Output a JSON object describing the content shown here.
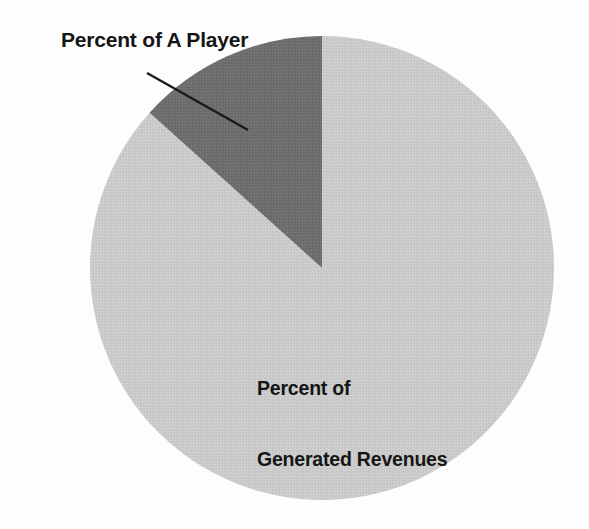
{
  "figure": {
    "background_color": "#fdfdfd",
    "width": 589,
    "height": 529
  },
  "callout": {
    "label": "Percent of A Player",
    "leader_line": {
      "from_x": 147,
      "from_y": 73,
      "to_x": 248,
      "to_y": 130,
      "color": "#1a1a1a"
    }
  },
  "center_label": {
    "line1": "Percent of",
    "line2": "Generated Revenues"
  },
  "chart_data": {
    "type": "pie",
    "title": "",
    "subtitle": "",
    "xlabel": "",
    "ylabel": "",
    "legend_position": "none",
    "grid": false,
    "center": {
      "cx": 322,
      "cy": 268
    },
    "radius": 232,
    "start_angle_deg": 0,
    "direction": "counterclockwise",
    "categories": [
      "Percent of A Player",
      "Percent of Generated Revenues"
    ],
    "values": [
      13,
      87
    ],
    "value_unit": "percent",
    "slices": [
      {
        "label": "Percent of A Player",
        "value": 13,
        "angle_deg": 48,
        "color": "#6d6d6d",
        "label_placement": "callout-outside-upper-left"
      },
      {
        "label": "Percent of Generated Revenues",
        "value": 87,
        "angle_deg": 312,
        "color": "#c9c9c9",
        "label_placement": "inside-lower-center"
      }
    ],
    "annotations": [
      {
        "text": "Percent of A Player",
        "target_slice": "Percent of A Player"
      },
      {
        "text": "Percent of Generated Revenues",
        "target_slice": "Percent of Generated Revenues"
      }
    ]
  },
  "colors": {
    "slice_dark": "#6d6d6d",
    "slice_light": "#c9c9c9",
    "text": "#151515",
    "leader_line": "#1a1a1a",
    "background": "#fdfdfd"
  }
}
